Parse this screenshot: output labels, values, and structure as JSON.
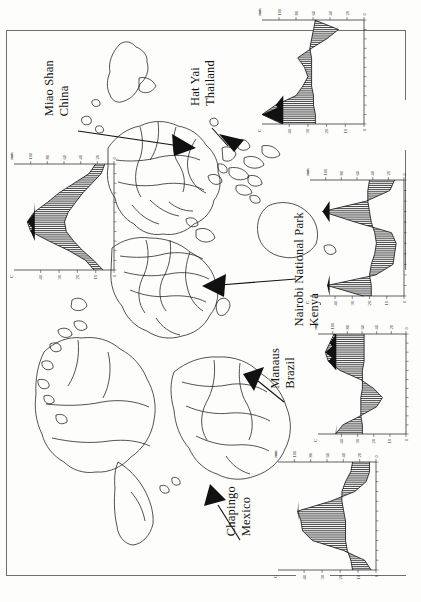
{
  "figure": {
    "type": "map-with-climate-diagrams",
    "orientation_deg": 90,
    "background": "#fdfdfc",
    "ink": "#111111"
  },
  "map": {
    "name": "world-outline-map",
    "projection_note": "world country outlines, landmasses only"
  },
  "sites": [
    {
      "id": "miao-shan",
      "name_line1": "Miao Shan",
      "name_line2": "China",
      "label_x": 52,
      "label_y": 66,
      "arrow_from": [
        78,
        131
      ],
      "arrow_to": [
        196,
        148
      ]
    },
    {
      "id": "hat-yai",
      "name_line1": "Hat Yai",
      "name_line2": "Thailand",
      "label_x": 196,
      "label_y": 66,
      "arrow_from": [
        212,
        129
      ],
      "arrow_to": [
        232,
        150
      ]
    },
    {
      "id": "nairobi",
      "name_line1": "Nairobi National Park",
      "name_line2": "Kenya",
      "label_x": 299,
      "label_y": 214,
      "arrow_from": [
        296,
        279
      ],
      "arrow_to": [
        202,
        286
      ]
    },
    {
      "id": "manaus",
      "name_line1": "Manaus",
      "name_line2": "Brazil",
      "label_x": 272,
      "label_y": 352,
      "arrow_from": [
        276,
        398
      ],
      "arrow_to": [
        247,
        378
      ]
    },
    {
      "id": "chapingo",
      "name_line1": "Chapingo",
      "name_line2": "Mexico",
      "label_x": 229,
      "label_y": 490,
      "arrow_from": [
        235,
        540
      ],
      "arrow_to": [
        214,
        492
      ]
    }
  ],
  "chart_data": [
    {
      "id": "miao-shan-climate",
      "type": "area",
      "title": "Miao Shan, China",
      "xlabel": "Month",
      "ylabel": "Precipitation (mm)",
      "y2label": "Temperature (°C)",
      "categories": [
        "J",
        "F",
        "M",
        "A",
        "M",
        "J",
        "J",
        "A",
        "S",
        "O",
        "N",
        "D"
      ],
      "precip_ticks": [
        0,
        20,
        40,
        60,
        80,
        100
      ],
      "precip_unit": "mm",
      "temp_ticks": [
        0,
        10,
        20,
        30,
        40
      ],
      "temp_unit": "°C",
      "series": [
        {
          "name": "precipitation",
          "fill": "hatched",
          "values": [
            22,
            30,
            48,
            66,
            80,
            96,
            104,
            100,
            78,
            54,
            34,
            24
          ]
        },
        {
          "name": "temperature",
          "fill": "line",
          "values": [
            5,
            7,
            12,
            17,
            21,
            25,
            27,
            26,
            22,
            17,
            11,
            6
          ]
        }
      ],
      "shading": {
        "arid": "dotted",
        "humid": "hatched",
        "perhumid": "solid-black"
      }
    },
    {
      "id": "hat-yai-climate",
      "type": "area",
      "title": "Hat Yai, Thailand",
      "xlabel": "Month",
      "ylabel": "Precipitation (mm)",
      "y2label": "Temperature (°C)",
      "categories": [
        "J",
        "F",
        "M",
        "A",
        "M",
        "J",
        "J",
        "A",
        "S",
        "O",
        "N",
        "D"
      ],
      "precip_ticks": [
        0,
        20,
        40,
        60,
        80,
        100
      ],
      "precip_unit": "mm",
      "temp_ticks": [
        0,
        10,
        20,
        30,
        40
      ],
      "temp_unit": "°C",
      "series": [
        {
          "name": "precipitation",
          "fill": "hatched",
          "values": [
            58,
            30,
            44,
            62,
            78,
            70,
            66,
            72,
            80,
            104,
            120,
            96
          ]
        },
        {
          "name": "temperature",
          "fill": "line",
          "values": [
            26,
            27,
            28,
            29,
            28,
            28,
            28,
            28,
            27,
            27,
            26,
            26
          ]
        }
      ],
      "shading": {
        "arid": "dotted",
        "humid": "hatched",
        "perhumid": "solid-black"
      }
    },
    {
      "id": "nairobi-climate",
      "type": "area",
      "title": "Nairobi National Park, Kenya",
      "xlabel": "Month",
      "ylabel": "Precipitation (mm)",
      "y2label": "Temperature (°C)",
      "categories": [
        "J",
        "F",
        "M",
        "A",
        "M",
        "J",
        "J",
        "A",
        "S",
        "O",
        "N",
        "D"
      ],
      "precip_ticks": [
        0,
        20,
        40,
        60,
        80,
        100
      ],
      "precip_unit": "mm",
      "temp_ticks": [
        0,
        10,
        20,
        30,
        40
      ],
      "temp_unit": "°C",
      "series": [
        {
          "name": "precipitation",
          "fill": "hatched",
          "values": [
            12,
            18,
            48,
            104,
            62,
            16,
            10,
            12,
            14,
            36,
            98,
            52
          ]
        },
        {
          "name": "temperature",
          "fill": "line",
          "values": [
            20,
            21,
            21,
            20,
            19,
            17,
            16,
            17,
            19,
            20,
            19,
            19
          ]
        }
      ],
      "shading": {
        "arid": "dotted",
        "humid": "hatched",
        "perhumid": "solid-black"
      }
    },
    {
      "id": "manaus-climate",
      "type": "area",
      "title": "Manaus, Brazil",
      "xlabel": "Month",
      "ylabel": "Precipitation (mm)",
      "y2label": "Temperature (°C)",
      "categories": [
        "J",
        "F",
        "M",
        "A",
        "M",
        "J",
        "J",
        "A",
        "S",
        "O",
        "N",
        "D"
      ],
      "precip_ticks": [
        0,
        20,
        40,
        60,
        80,
        100
      ],
      "precip_unit": "mm",
      "temp_ticks": [
        0,
        10,
        20,
        30,
        40
      ],
      "temp_unit": "°C",
      "series": [
        {
          "name": "precipitation",
          "fill": "hatched",
          "values": [
            98,
            104,
            110,
            106,
            90,
            62,
            44,
            32,
            40,
            62,
            86,
            96
          ]
        },
        {
          "name": "temperature",
          "fill": "line",
          "values": [
            26,
            26,
            26,
            26,
            27,
            27,
            27,
            28,
            28,
            28,
            27,
            27
          ]
        }
      ],
      "shading": {
        "arid": "dotted",
        "humid": "hatched",
        "perhumid": "solid-black"
      }
    },
    {
      "id": "chapingo-climate",
      "type": "area",
      "title": "Chapingo, Mexico",
      "xlabel": "Month",
      "ylabel": "Precipitation (mm)",
      "y2label": "Temperature (°C)",
      "categories": [
        "J",
        "F",
        "M",
        "A",
        "M",
        "J",
        "J",
        "A",
        "S",
        "O",
        "N",
        "D"
      ],
      "precip_ticks": [
        0,
        20,
        40,
        60,
        80,
        100
      ],
      "precip_unit": "mm",
      "temp_ticks": [
        0,
        10,
        20,
        30,
        40
      ],
      "temp_unit": "°C",
      "series": [
        {
          "name": "precipitation",
          "fill": "hatched",
          "values": [
            8,
            8,
            12,
            26,
            56,
            96,
            92,
            90,
            78,
            40,
            14,
            6
          ]
        },
        {
          "name": "temperature",
          "fill": "line",
          "values": [
            13,
            14,
            17,
            19,
            19,
            18,
            17,
            17,
            17,
            16,
            14,
            13
          ]
        }
      ],
      "shading": {
        "arid": "dotted",
        "humid": "hatched",
        "perhumid": "solid-black"
      }
    }
  ]
}
